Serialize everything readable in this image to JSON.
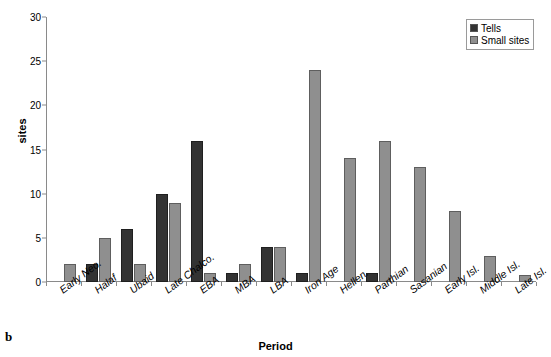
{
  "panel_letter": "b",
  "chart_data": {
    "type": "bar",
    "title": "",
    "xlabel": "Period",
    "ylabel": "sites",
    "ylim": [
      0,
      30
    ],
    "yticks": [
      0,
      5,
      10,
      15,
      20,
      25,
      30
    ],
    "grid": false,
    "legend_position": "top-right",
    "categories": [
      "Early Neo.",
      "Halaf",
      "Ubaid",
      "Late Chalco.",
      "EBA",
      "MBA",
      "LBA",
      "Iron Age",
      "Hellen.",
      "Parthian",
      "Sasanian",
      "Early Isl.",
      "Middle Isl.",
      "Late Isl."
    ],
    "series": [
      {
        "name": "Tells",
        "color": "#333333",
        "values": [
          0,
          2,
          6,
          10,
          16,
          1,
          4,
          1,
          0,
          1,
          0,
          0,
          0,
          0
        ]
      },
      {
        "name": "Small sites",
        "color": "#8f8f8f",
        "values": [
          2,
          5,
          2,
          9,
          1,
          2,
          4,
          24,
          14,
          16,
          13,
          8,
          3,
          0.8
        ]
      }
    ]
  }
}
